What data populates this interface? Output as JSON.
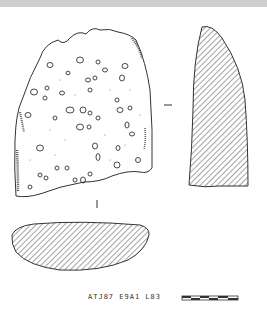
{
  "drawing": {
    "type": "archaeological sherd drawing",
    "views": [
      "exterior-face",
      "profile-section",
      "plan-section"
    ],
    "catalog_label": "ATJ87 E9A1 L83",
    "scale_bar": {
      "segments": 6
    },
    "colors": {
      "ink": "#333333",
      "background": "#ffffff",
      "top_band": "#cfcfcf"
    }
  }
}
